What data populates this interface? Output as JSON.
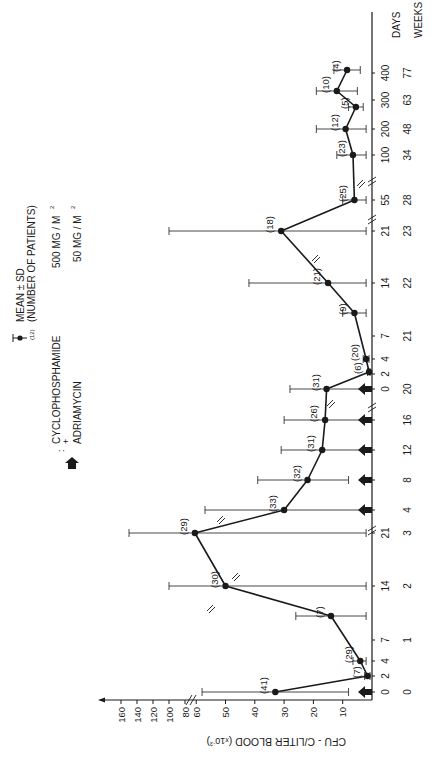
{
  "chart_data": {
    "type": "line",
    "orientation": "rotated-90-clockwise",
    "title": "",
    "ylabel": "CFU - C/LITER BLOOD (x10^-3)",
    "ylabel_parts": {
      "main": "CFU - C/LITER BLOOD (",
      "mult": "x",
      "base": "10",
      "exp": "-3",
      "close": ")"
    },
    "xlabel_rows": [
      "DAYS",
      "WEEKS"
    ],
    "y_ticks": [
      10,
      20,
      30,
      40,
      50,
      60,
      80,
      100,
      120,
      140,
      160
    ],
    "y_break": "between 60 and 80 (scale compressed above 60)",
    "x_ticks": [
      {
        "day": "0",
        "week": "0",
        "pos": 692
      },
      {
        "day": "2",
        "week": "",
        "pos": 676
      },
      {
        "day": "4",
        "week": "",
        "pos": 661
      },
      {
        "day": "7",
        "week": "1",
        "pos": 640
      },
      {
        "day": "14",
        "week": "2",
        "pos": 586
      },
      {
        "day": "21",
        "week": "3",
        "pos": 533
      },
      {
        "day": "",
        "week": "4",
        "pos": 510
      },
      {
        "day": "",
        "week": "8",
        "pos": 480
      },
      {
        "day": "",
        "week": "12",
        "pos": 450
      },
      {
        "day": "",
        "week": "16",
        "pos": 420
      },
      {
        "day": "0",
        "week": "20",
        "pos": 389
      },
      {
        "day": "2",
        "week": "",
        "pos": 374
      },
      {
        "day": "4",
        "week": "",
        "pos": 359
      },
      {
        "day": "7",
        "week": "21",
        "pos": 336
      },
      {
        "day": "14",
        "week": "22",
        "pos": 283
      },
      {
        "day": "21",
        "week": "23",
        "pos": 231
      },
      {
        "day": "55",
        "week": "28",
        "pos": 200
      },
      {
        "day": "100",
        "week": "34",
        "pos": 155
      },
      {
        "day": "200",
        "week": "48",
        "pos": 129
      },
      {
        "day": "300",
        "week": "63",
        "pos": 100
      },
      {
        "day": "400",
        "week": "77",
        "pos": 73
      }
    ],
    "x_breaks": [
      {
        "pos": 527,
        "note": "after day 21 (week 3)"
      },
      {
        "pos": 404,
        "note": "between week 16 and week 20"
      },
      {
        "pos": 216,
        "note": "between day 21 and day 55"
      },
      {
        "pos": 178,
        "note": "between day 55 and day 100"
      }
    ],
    "series": [
      {
        "name": "Mean ± SD",
        "points": [
          {
            "time": "Day 0",
            "pos": 692,
            "mean": 33,
            "sd_low": 8,
            "sd_high": 58,
            "n": 41
          },
          {
            "time": "Day 2",
            "pos": 676,
            "mean": 1.5,
            "sd_low": 0.5,
            "sd_high": 2.5,
            "n": 7
          },
          {
            "time": "Day 4",
            "pos": 661,
            "mean": 4,
            "sd_low": 2,
            "sd_high": 6.5,
            "n": 29
          },
          {
            "time": "Day 10",
            "pos": 616,
            "mean": 14,
            "sd_low": 2,
            "sd_high": 26,
            "n": 7
          },
          {
            "time": "Day 14",
            "pos": 586,
            "mean": 50,
            "sd_low": 2,
            "sd_high": 100,
            "n": 30
          },
          {
            "time": "Week 3 (Day 21)",
            "pos": 533,
            "mean": 62,
            "sd_low": 2,
            "sd_high": 150,
            "n": 29
          },
          {
            "time": "Week 4",
            "pos": 510,
            "mean": 30,
            "sd_low": 3,
            "sd_high": 57,
            "n": 33
          },
          {
            "time": "Week 8",
            "pos": 480,
            "mean": 22,
            "sd_low": 8,
            "sd_high": 39,
            "n": 32
          },
          {
            "time": "Week 12",
            "pos": 450,
            "mean": 17,
            "sd_low": 3,
            "sd_high": 31,
            "n": 31
          },
          {
            "time": "Week 16",
            "pos": 420,
            "mean": 16,
            "sd_low": 3,
            "sd_high": 30,
            "n": 26
          },
          {
            "time": "Week 20 Day 0",
            "pos": 389,
            "mean": 15.5,
            "sd_low": 3,
            "sd_high": 28,
            "n": 31
          },
          {
            "time": "Week 20 Day 2",
            "pos": 372,
            "mean": 1,
            "sd_low": 0.5,
            "sd_high": 1.5,
            "n": 6
          },
          {
            "time": "Week 20 Day 4",
            "pos": 359,
            "mean": 2,
            "sd_low": 1,
            "sd_high": 3,
            "n": 20
          },
          {
            "time": "Week 20 Day 10",
            "pos": 313,
            "mean": 6,
            "sd_low": 2,
            "sd_high": 10,
            "n": 9
          },
          {
            "time": "Week 22 (Day 14)",
            "pos": 283,
            "mean": 15,
            "sd_low": 2,
            "sd_high": 42,
            "n": 21
          },
          {
            "time": "Week 23 (Day 21)",
            "pos": 231,
            "mean": 31,
            "sd_low": 2,
            "sd_high": 100,
            "n": 18
          },
          {
            "time": "Week 28 (Day 55)",
            "pos": 200,
            "mean": 6,
            "sd_low": 2,
            "sd_high": 10,
            "n": 25
          },
          {
            "time": "Week 34 (Day 100)",
            "pos": 155,
            "mean": 6.5,
            "sd_low": 2,
            "sd_high": 12,
            "n": 23
          },
          {
            "time": "Week 48 (Day 200)",
            "pos": 129,
            "mean": 9,
            "sd_low": 2,
            "sd_high": 19,
            "n": 12
          },
          {
            "time": "Day ~280",
            "pos": 107,
            "mean": 5.5,
            "sd_low": 3,
            "sd_high": 8,
            "n": 5
          },
          {
            "time": "Week 63 (Day ~330)",
            "pos": 91,
            "mean": 12,
            "sd_low": 5,
            "sd_high": 19,
            "n": 10
          },
          {
            "time": "Week 77 (Day 400)",
            "pos": 70,
            "mean": 8.5,
            "sd_low": 4,
            "sd_high": 13,
            "n": 4
          }
        ]
      }
    ],
    "treatment_arrows_at": [
      "Week 0",
      "Week 4",
      "Week 8",
      "Week 12",
      "Week 16",
      "Week 20"
    ],
    "treatment_arrow_pos": [
      692,
      510,
      480,
      450,
      420,
      389
    ],
    "legend": {
      "marker_label_1": "MEAN ± SD",
      "marker_label_2": "(NUMBER  OF  PATIENTS)",
      "marker_sample_n": "(12)",
      "arrow_colon": ":",
      "drug1": "CYCLOPHOSPHAMIDE",
      "drug1_dose": "500 MG / M",
      "plus": "+",
      "drug2": "ADRIAMYCIN",
      "drug2_dose": "50 MG / M",
      "sq": "2"
    },
    "grid": false,
    "colors": {
      "ink": "#1a1a1a",
      "background": "#ffffff"
    }
  }
}
